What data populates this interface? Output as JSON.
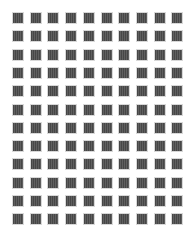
{
  "grid": {
    "rows": 12,
    "columns": 10,
    "origin_x": 13,
    "origin_y": 13,
    "column_pitch": 17.7,
    "row_pitch": 18.3,
    "cell_size": 10,
    "cell_color": "#565656",
    "cell_border_color": "#d8d8d8",
    "background_color": "#ffffff"
  }
}
